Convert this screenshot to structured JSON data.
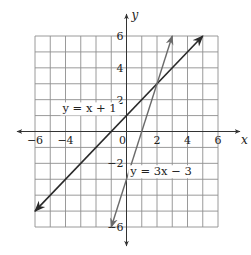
{
  "chart_data": {
    "type": "line",
    "title": "",
    "xlabel": "x",
    "ylabel": "y",
    "xlim": [
      -6,
      6
    ],
    "ylim": [
      -6,
      6
    ],
    "grid": true,
    "grid_step": 1,
    "x_ticks": [
      {
        "value": -6,
        "label": "−6"
      },
      {
        "value": -4,
        "label": "−4"
      },
      {
        "value": 0,
        "label": "0"
      },
      {
        "value": 2,
        "label": "2"
      },
      {
        "value": 4,
        "label": "4"
      },
      {
        "value": 6,
        "label": "6"
      }
    ],
    "y_ticks": [
      {
        "value": 6,
        "label": "6"
      },
      {
        "value": 4,
        "label": "4"
      },
      {
        "value": 2,
        "label": "2"
      },
      {
        "value": -2,
        "label": "−2"
      },
      {
        "value": -6,
        "label": "−6"
      }
    ],
    "series": [
      {
        "name": "y = x + 1",
        "label": "y = x + 1",
        "slope": 1,
        "intercept": 1,
        "x": [
          -6,
          5
        ],
        "y": [
          -5,
          6
        ],
        "color": "#2a2a2a",
        "arrows": "both",
        "label_pos": {
          "x": -4.2,
          "y": 1.2
        }
      },
      {
        "name": "y = 3x − 3",
        "label": "y = 3x − 3",
        "slope": 3,
        "intercept": -3,
        "x": [
          -1,
          3
        ],
        "y": [
          -6,
          6
        ],
        "color": "#6a6a6a",
        "arrows": "both",
        "label_pos": {
          "x": 0.25,
          "y": -2.75
        }
      }
    ],
    "intersection": {
      "x": 2,
      "y": 3
    },
    "legend": "none (inline labels)"
  },
  "axes": {
    "x_label": "x",
    "y_label": "y"
  }
}
